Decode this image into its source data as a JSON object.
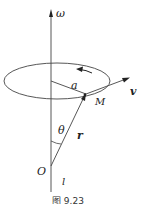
{
  "labels": {
    "omega": "ω",
    "a": "a",
    "v": "v",
    "M": "M",
    "theta": "θ",
    "r": "r",
    "O": "O",
    "l": "l"
  },
  "caption": "图 9.23"
}
